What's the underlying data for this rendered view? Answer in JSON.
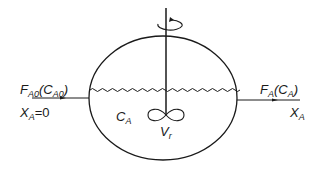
{
  "diagram": {
    "type": "CSTR (continuous stirred tank reactor) schematic",
    "inlet": {
      "flow_symbol": "F",
      "flow_sub": "A0",
      "conc_symbol": "C",
      "conc_sub": "A0",
      "conversion_symbol": "X",
      "conversion_sub": "A",
      "conversion_value": "=0"
    },
    "outlet": {
      "flow_symbol": "F",
      "flow_sub": "A",
      "conc_symbol": "C",
      "conc_sub": "A",
      "conversion_symbol": "X",
      "conversion_sub": "A"
    },
    "vessel": {
      "conc_symbol": "C",
      "conc_sub": "A",
      "volume_symbol": "V",
      "volume_sub": "r"
    },
    "icons": [
      "rotation-arrow-icon",
      "impeller-icon",
      "liquid-surface-wave",
      "inlet-arrow",
      "outlet-arrow"
    ],
    "colors": {
      "stroke": "#1a1a1a",
      "background": "#ffffff"
    }
  }
}
